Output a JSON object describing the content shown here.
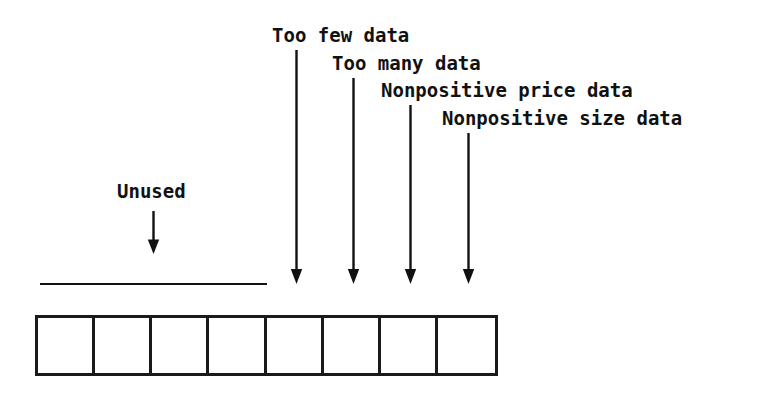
{
  "diagram": {
    "stroke_color": "#111111",
    "background_color": "#ffffff",
    "callouts": [
      {
        "id": "unused",
        "label": "Unused",
        "label_left": 117,
        "label_top": 182,
        "arrow_x": 153,
        "arrow_top": 211,
        "arrow_bottom": 254
      },
      {
        "id": "too-few-data",
        "label": "Too few data",
        "label_left": 272,
        "label_top": 26,
        "arrow_x": 296,
        "arrow_top": 50,
        "arrow_bottom": 284
      },
      {
        "id": "too-many-data",
        "label": "Too many data",
        "label_left": 332,
        "label_top": 54,
        "arrow_x": 353,
        "arrow_top": 78,
        "arrow_bottom": 284
      },
      {
        "id": "nonpositive-price-data",
        "label": "Nonpositive price data",
        "label_left": 381,
        "label_top": 81,
        "arrow_x": 410,
        "arrow_top": 105,
        "arrow_bottom": 284
      },
      {
        "id": "nonpositive-size-data",
        "label": "Nonpositive size data",
        "label_left": 442,
        "label_top": 109,
        "arrow_x": 468,
        "arrow_top": 133,
        "arrow_bottom": 284
      }
    ],
    "unused_span_line": {
      "left": 40,
      "top": 283,
      "width": 227,
      "thickness": 2
    },
    "array": {
      "left": 35,
      "top": 315,
      "width": 463,
      "height": 61,
      "cell_count": 8,
      "cells": [
        "",
        "",
        "",
        "",
        "",
        "",
        "",
        ""
      ]
    }
  }
}
